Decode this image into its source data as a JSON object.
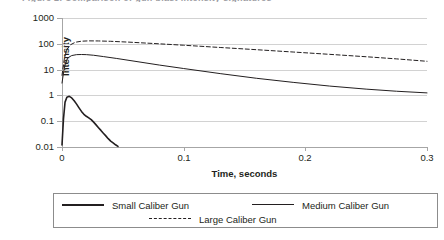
{
  "figure": {
    "title_clipped": "Figure 2. Comparison of gun blast intensity signatures",
    "background": "#ffffff",
    "line_color": "#231f20",
    "grid_color": "#d2d2d2",
    "axis_color": "#a6a6a6"
  },
  "chart_data": {
    "type": "line",
    "title": "",
    "xlabel": "Time, seconds",
    "ylabel": "Intensity",
    "xlim": [
      0,
      0.3
    ],
    "ylim": [
      0.01,
      1000
    ],
    "yscale": "log",
    "xscale": "linear",
    "grid": true,
    "legend_position": "bottom",
    "xticks": [
      0,
      0.1,
      0.2,
      0.3
    ],
    "xticklabels": [
      "0",
      "0.1",
      "0.2",
      "0.3"
    ],
    "yticks": [
      0.01,
      0.1,
      1,
      10,
      100,
      1000
    ],
    "yticklabels": [
      "0.01",
      "0.1",
      "1",
      "10",
      "100",
      "1000"
    ],
    "series": [
      {
        "name": "Small Caliber Gun",
        "style": "solid",
        "width": 1.6,
        "x": [
          0.0,
          0.0012,
          0.0025,
          0.004,
          0.006,
          0.008,
          0.01,
          0.012,
          0.014,
          0.016,
          0.018,
          0.02,
          0.022,
          0.024,
          0.026,
          0.028,
          0.03,
          0.032,
          0.034,
          0.036,
          0.038,
          0.04,
          0.042,
          0.044,
          0.046
        ],
        "y": [
          0.012,
          0.12,
          0.55,
          0.85,
          0.92,
          0.8,
          0.62,
          0.46,
          0.33,
          0.24,
          0.185,
          0.155,
          0.135,
          0.115,
          0.092,
          0.072,
          0.056,
          0.044,
          0.034,
          0.027,
          0.021,
          0.017,
          0.0145,
          0.0122,
          0.0105
        ]
      },
      {
        "name": "Medium Caliber Gun",
        "style": "solid",
        "width": 1.0,
        "x": [
          0.0,
          0.0015,
          0.003,
          0.005,
          0.008,
          0.012,
          0.016,
          0.02,
          0.026,
          0.034,
          0.045,
          0.06,
          0.08,
          0.1,
          0.13,
          0.16,
          0.19,
          0.22,
          0.25,
          0.275,
          0.3
        ],
        "y": [
          3.0,
          9.0,
          19.0,
          29.0,
          35.0,
          38.0,
          38.5,
          38.0,
          36.0,
          32.0,
          27.0,
          21.0,
          15.0,
          11.0,
          7.0,
          4.6,
          3.2,
          2.3,
          1.75,
          1.45,
          1.25
        ]
      },
      {
        "name": "Large Caliber Gun",
        "style": "dashed",
        "width": 1.0,
        "x": [
          0.0,
          0.002,
          0.004,
          0.007,
          0.011,
          0.016,
          0.022,
          0.03,
          0.04,
          0.055,
          0.075,
          0.1,
          0.13,
          0.16,
          0.19,
          0.22,
          0.25,
          0.275,
          0.3
        ],
        "y": [
          6.0,
          28.0,
          60.0,
          92.0,
          115.0,
          126.0,
          130.0,
          129.0,
          125.0,
          116.0,
          103.0,
          88.0,
          72.0,
          59.0,
          48.0,
          39.0,
          31.5,
          26.0,
          21.0
        ]
      }
    ]
  },
  "legend": {
    "entries": [
      {
        "label": "Small Caliber Gun",
        "swatch": "solid-thick"
      },
      {
        "label": "Medium Caliber Gun",
        "swatch": "solid-thin"
      },
      {
        "label": "Large Caliber Gun",
        "swatch": "dashed"
      }
    ]
  }
}
